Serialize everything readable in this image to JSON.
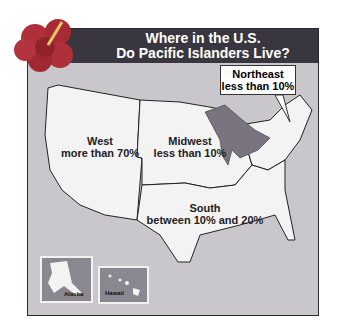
{
  "title": {
    "line1": "Where in the U.S.",
    "line2": "Do Pacific Islanders Live?"
  },
  "regions": [
    {
      "name": "West",
      "value": "more than 70%"
    },
    {
      "name": "Midwest",
      "value": "less than 10%"
    },
    {
      "name": "South",
      "value": "between 10% and 20%"
    },
    {
      "name": "Northeast",
      "value": "less than 10%"
    }
  ],
  "insets": {
    "alaska": "Alaska",
    "hawaii": "Hawaii"
  },
  "colors": {
    "header": "#3a3640",
    "background": "#c9c7cc",
    "land": "#f2f2f2",
    "lakes": "#7a7480",
    "flower": "#b0303a"
  }
}
